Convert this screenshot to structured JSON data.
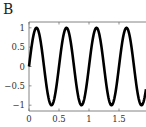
{
  "panel_label": "B",
  "chart_data": {
    "type": "line",
    "title": "",
    "xlabel": "",
    "ylabel": "",
    "xlim": [
      0,
      1.95
    ],
    "ylim": [
      -1.15,
      1.15
    ],
    "xticks": [
      0,
      0.5,
      1,
      1.5
    ],
    "xtick_labels": [
      "0",
      "0.5",
      "1",
      "1.5"
    ],
    "yticks": [
      1,
      0.5,
      0,
      -0.5,
      -1
    ],
    "ytick_labels": [
      "1",
      "0.5",
      "0",
      "−0.5",
      "−1"
    ],
    "grid": false,
    "legend": null,
    "series": [
      {
        "name": "sin(2π·2t)",
        "function": "y = sin(4*pi*x)",
        "frequency_hz": 2,
        "amplitude": 1,
        "color": "#000000",
        "x": [
          0,
          0.125,
          0.25,
          0.375,
          0.5,
          0.625,
          0.75,
          0.875,
          1.0,
          1.125,
          1.25,
          1.375,
          1.5,
          1.625,
          1.75,
          1.875,
          1.95
        ],
        "y": [
          0,
          1,
          0,
          -1,
          0,
          1,
          0,
          -1,
          0,
          1,
          0,
          -1,
          0,
          1,
          0,
          -1,
          -0.59
        ]
      }
    ]
  }
}
